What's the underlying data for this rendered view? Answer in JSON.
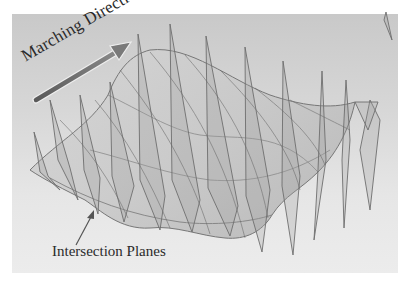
{
  "figure": {
    "labels": {
      "marching_direction": "Marching Direction",
      "intersection_planes": "Intersection Planes"
    },
    "colors": {
      "background_top": "#c9c9c9",
      "background_bottom": "#ececec",
      "surface_fill": "#b8b8b8",
      "plane_fill": "#a0a0a0",
      "line": "#6a6a6a",
      "arrow": "#7a7a7a",
      "text": "#2a2a2a"
    },
    "plane_count": 14
  }
}
